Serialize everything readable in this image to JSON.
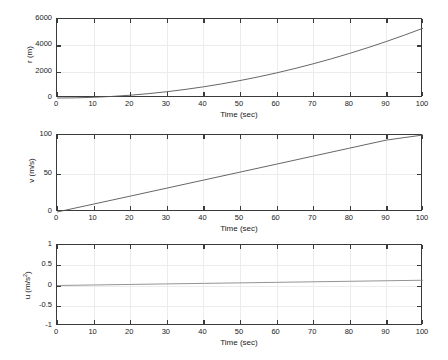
{
  "figure": {
    "title": "",
    "panel_count": 3
  },
  "chart_data": [
    {
      "type": "line",
      "title": "",
      "xlabel": "Time (sec)",
      "ylabel": "r (m)",
      "ylabel_plain": "r (m)",
      "xlim": [
        0,
        100
      ],
      "ylim": [
        0,
        6000
      ],
      "xticks": [
        0,
        10,
        20,
        30,
        40,
        50,
        60,
        70,
        80,
        90,
        100
      ],
      "xticklabels": [
        "0",
        "10",
        "20",
        "30",
        "40",
        "50",
        "60",
        "70",
        "80",
        "90",
        "100"
      ],
      "yticks": [
        0,
        2000,
        4000,
        6000
      ],
      "yticklabels": [
        "0",
        "2000",
        "4000",
        "6000"
      ],
      "grid": true,
      "legend": "none",
      "series": [
        {
          "name": "r",
          "color": "#555555",
          "x": [
            0,
            5,
            10,
            15,
            20,
            25,
            30,
            35,
            40,
            45,
            50,
            55,
            60,
            65,
            70,
            75,
            80,
            85,
            90,
            95,
            100
          ],
          "values": [
            0,
            13,
            53,
            119,
            212,
            331,
            477,
            649,
            848,
            1073,
            1325,
            1603,
            1908,
            2239,
            2597,
            2981,
            3392,
            3829,
            4293,
            4783,
            5300
          ]
        }
      ]
    },
    {
      "type": "line",
      "title": "",
      "xlabel": "Time (sec)",
      "ylabel": "v (m/s)",
      "ylabel_plain": "v (m/s)",
      "xlim": [
        0,
        100
      ],
      "ylim": [
        0,
        100
      ],
      "xticks": [
        0,
        10,
        20,
        30,
        40,
        50,
        60,
        70,
        80,
        90,
        100
      ],
      "xticklabels": [
        "0",
        "10",
        "20",
        "30",
        "40",
        "50",
        "60",
        "70",
        "80",
        "90",
        "100"
      ],
      "yticks": [
        0,
        50,
        100
      ],
      "yticklabels": [
        "0",
        "50",
        "100"
      ],
      "grid": true,
      "legend": "none",
      "series": [
        {
          "name": "v",
          "color": "#555555",
          "x": [
            0,
            10,
            20,
            30,
            40,
            50,
            60,
            70,
            80,
            90,
            100
          ],
          "values": [
            0,
            10.3,
            20.6,
            31.0,
            41.4,
            51.8,
            62.2,
            72.6,
            83.0,
            93.4,
            103.5
          ]
        }
      ]
    },
    {
      "type": "line",
      "title": "",
      "xlabel": "Time (sec)",
      "ylabel": "u (m/s2)",
      "ylabel_plain": "u (m/s",
      "ylabel_sup": "2",
      "ylabel_tail": ")",
      "xlim": [
        0,
        100
      ],
      "ylim": [
        -1,
        1
      ],
      "xticks": [
        0,
        10,
        20,
        30,
        40,
        50,
        60,
        70,
        80,
        90,
        100
      ],
      "xticklabels": [
        "0",
        "10",
        "20",
        "30",
        "40",
        "50",
        "60",
        "70",
        "80",
        "90",
        "100"
      ],
      "yticks": [
        -1,
        -0.5,
        0,
        0.5,
        1
      ],
      "yticklabels": [
        "-1",
        "-0.5",
        "0",
        "0.5",
        "1"
      ],
      "grid": true,
      "legend": "none",
      "series": [
        {
          "name": "u",
          "color": "#888888",
          "x": [
            0,
            10,
            20,
            30,
            40,
            50,
            60,
            70,
            80,
            90,
            100
          ],
          "values": [
            0.0,
            0.013,
            0.026,
            0.039,
            0.052,
            0.065,
            0.078,
            0.091,
            0.104,
            0.117,
            0.13
          ]
        }
      ]
    }
  ],
  "colors": {
    "axis": "#3a3a3a",
    "grid": "#ececec",
    "curve": "#555555",
    "curve_light": "#888888",
    "background": "#ffffff",
    "text": "#1a1a1a"
  }
}
